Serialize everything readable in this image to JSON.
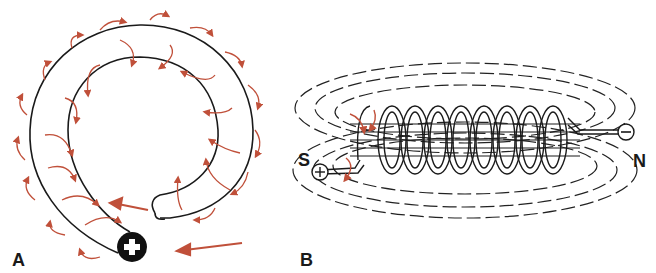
{
  "figure": {
    "panels": [
      {
        "id": "A",
        "label": "A",
        "description": "Single wire loop (coil turn) carrying current with circular magnetic field arrows around the conductor",
        "terminal": "+",
        "current_arrows": 2
      },
      {
        "id": "B",
        "label": "B",
        "description": "Solenoid coil with magnetic field lines showing north and south poles",
        "pole_left": "S",
        "pole_right": "N",
        "terminal_left": "+",
        "terminal_right": "−",
        "turns": 9
      }
    ],
    "colors": {
      "wire": "#1a1a1a",
      "field_arrow": "#c0503a",
      "background": "#ffffff"
    }
  }
}
